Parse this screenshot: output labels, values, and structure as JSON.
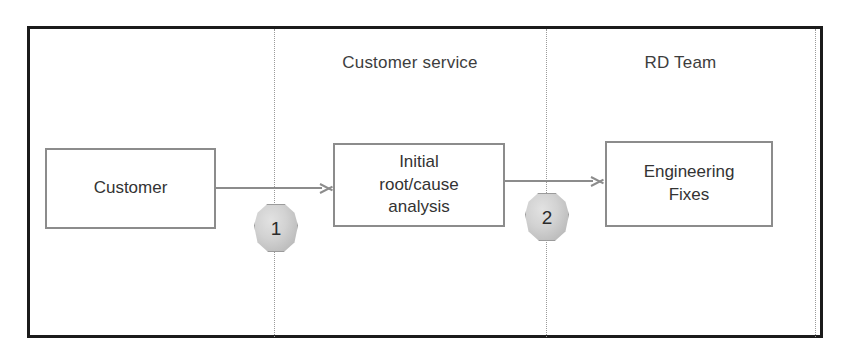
{
  "diagram": {
    "lanes": [
      {
        "id": "lane-unlabeled",
        "label": ""
      },
      {
        "id": "lane-customer-service",
        "label": "Customer service"
      },
      {
        "id": "lane-rd-team",
        "label": "RD Team"
      }
    ],
    "nodes": [
      {
        "id": "customer",
        "label": "Customer"
      },
      {
        "id": "initial-root-cause-analysis",
        "label": "Initial\nroot/cause\nanalysis"
      },
      {
        "id": "engineering-fixes",
        "label": "Engineering\nFixes"
      }
    ],
    "connectors": [
      {
        "id": "customer-to-analysis",
        "from": "customer",
        "to": "initial-root-cause-analysis",
        "badge": "1"
      },
      {
        "id": "analysis-to-engineering",
        "from": "initial-root-cause-analysis",
        "to": "engineering-fixes",
        "badge": "2"
      }
    ],
    "badges": [
      {
        "id": "step-1",
        "number": "1"
      },
      {
        "id": "step-2",
        "number": "2"
      }
    ],
    "colors": {
      "frame_border": "#1b1b1b",
      "box_border": "#8c8c8c",
      "box_fill": "#ffffff",
      "connector": "#8c8c8c",
      "divider": "#9a9a9a",
      "badge_fill": "#d2d2d2",
      "badge_border": "#9b9b9b",
      "text": "#333333",
      "background": "#ffffff"
    }
  }
}
